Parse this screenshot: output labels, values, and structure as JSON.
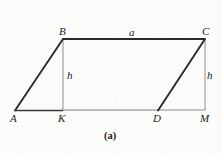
{
  "figure": {
    "caption": "(a)",
    "background_color": "#fbfbfa",
    "stroke_dark": "#2b2b2b",
    "stroke_light": "#8d8d8d",
    "shape_name": "parallelogram-abcd",
    "vertices": [
      {
        "id": "A",
        "label": "A",
        "x": 15,
        "y": 110,
        "label_x": 10,
        "label_y": 113
      },
      {
        "id": "B",
        "label": "B",
        "x": 63,
        "y": 39,
        "label_x": 59,
        "label_y": 26
      },
      {
        "id": "C",
        "label": "C",
        "x": 205,
        "y": 39,
        "label_x": 202,
        "label_y": 26
      },
      {
        "id": "D",
        "label": "D",
        "x": 158,
        "y": 110,
        "label_x": 153,
        "label_y": 113
      },
      {
        "id": "K",
        "label": "K",
        "x": 63,
        "y": 110,
        "label_x": 58,
        "label_y": 113
      },
      {
        "id": "M",
        "label": "M",
        "x": 205,
        "y": 110,
        "label_x": 200,
        "label_y": 113
      }
    ],
    "measures": [
      {
        "id": "side-a",
        "label": "a",
        "label_x": 129,
        "label_y": 27
      },
      {
        "id": "height-h-left",
        "label": "h",
        "label_x": 67,
        "label_y": 70
      },
      {
        "id": "height-h-right",
        "label": "h",
        "label_x": 207,
        "label_y": 70
      }
    ],
    "edges": [
      {
        "id": "edge-AB",
        "from": "A",
        "to": "B",
        "weight": "thick"
      },
      {
        "id": "edge-BC",
        "from": "B",
        "to": "C",
        "weight": "thick"
      },
      {
        "id": "edge-CD",
        "from": "C",
        "to": "D",
        "weight": "thick"
      },
      {
        "id": "edge-AD",
        "from": "A",
        "to": "D",
        "weight": "thick"
      },
      {
        "id": "edge-BK",
        "from": "B",
        "to": "K",
        "weight": "thin"
      },
      {
        "id": "edge-CM",
        "from": "C",
        "to": "M",
        "weight": "thin"
      },
      {
        "id": "edge-DM",
        "from": "D",
        "to": "M",
        "weight": "thin"
      }
    ]
  }
}
